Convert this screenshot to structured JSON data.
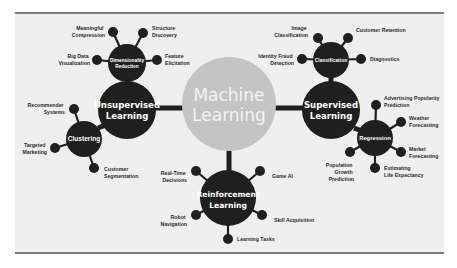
{
  "center": {
    "line1": "Machine",
    "line2": "Learning"
  },
  "unsupervised": {
    "line1": "Unsupervised",
    "line2": "Learning",
    "dimensionality_reduction": {
      "line1": "Dimensionality",
      "line2": "Reduction",
      "leaves": [
        {
          "line1": "Meaningful",
          "line2": "Compression"
        },
        {
          "line1": "Structure",
          "line2": "Discovery"
        },
        {
          "line1": "Big Data",
          "line2": "Visualization"
        },
        {
          "line1": "Feature",
          "line2": "Elicitation"
        }
      ]
    },
    "clustering": {
      "label": "Clustering",
      "leaves": [
        {
          "line1": "Recommender",
          "line2": "Systems"
        },
        {
          "line1": "Targeted",
          "line2": "Marketing"
        },
        {
          "line1": "Customer",
          "line2": "Segmentation"
        }
      ]
    }
  },
  "supervised": {
    "line1": "Supervised",
    "line2": "Learning",
    "classification": {
      "label": "Classification",
      "leaves": [
        {
          "line1": "Image",
          "line2": "Classification"
        },
        {
          "line1": "Customer Retention",
          "line2": ""
        },
        {
          "line1": "Identity Fraud",
          "line2": "Detection"
        },
        {
          "line1": "Diagnostics",
          "line2": ""
        }
      ]
    },
    "regression": {
      "label": "Regression",
      "leaves": [
        {
          "line1": "Advertising Popularity",
          "line2": "Prediction"
        },
        {
          "line1": "Weather",
          "line2": "Forecasting"
        },
        {
          "line1": "Market",
          "line2": "Forecasting"
        },
        {
          "line1": "Estimating",
          "line2": "Life Expectancy"
        },
        {
          "line1": "Population",
          "line2": "Growth",
          "line3": "Prediction"
        }
      ]
    }
  },
  "reinforcement": {
    "line1": "Reinforcement",
    "line2": "Learning",
    "leaves": [
      {
        "line1": "Real-Time",
        "line2": "Decisions"
      },
      {
        "line1": "Game AI",
        "line2": ""
      },
      {
        "line1": "Robot",
        "line2": "Navigation"
      },
      {
        "line1": "Skill Acquisition",
        "line2": ""
      },
      {
        "line1": "Learning Tasks",
        "line2": ""
      }
    ]
  }
}
